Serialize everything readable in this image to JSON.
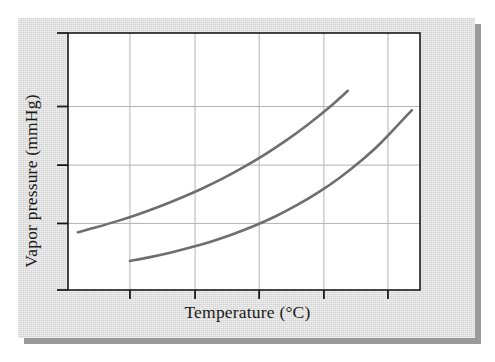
{
  "figure": {
    "background_color": "#dcdcdc",
    "shadow_color": "#9a9a9a",
    "plot_background_color": "#ffffff",
    "axis_color": "#1a1a1a",
    "grid_color": "#b3b3b3",
    "curve_color": "#6e6e6e"
  },
  "chart_data": {
    "type": "line",
    "title": "",
    "subtitle": "",
    "xlabel": "Temperature (°C)",
    "ylabel": "Vapor pressure (mmHg)",
    "x_tick_labels": [
      "",
      "",
      "",
      "",
      "",
      ""
    ],
    "y_tick_labels": [
      "",
      "",
      "",
      "",
      ""
    ],
    "xlim": [
      0,
      100
    ],
    "ylim": [
      0,
      100
    ],
    "grid": true,
    "grid_x_positions": [
      17.6,
      36.1,
      54.3,
      72.7,
      90.9
    ],
    "grid_y_positions": [
      25.9,
      48.6,
      71.4
    ],
    "legend": null,
    "legend_position": "none",
    "annotations": [],
    "series": [
      {
        "name": "curve-1",
        "comment": "upper-left curve: more volatile liquid, lower boiling point",
        "x": [
          2.8,
          8.0,
          14.0,
          20.0,
          26.0,
          32.0,
          38.0,
          44.0,
          50.0,
          56.0,
          62.0,
          68.0,
          74.0,
          79.5
        ],
        "y": [
          22.5,
          24.4,
          26.8,
          29.5,
          32.5,
          35.8,
          39.4,
          43.4,
          47.9,
          52.8,
          58.2,
          64.2,
          70.8,
          77.5
        ]
      },
      {
        "name": "curve-2",
        "comment": "lower-right curve: less volatile liquid, higher boiling point",
        "x": [
          17.6,
          23.0,
          29.0,
          35.0,
          41.0,
          47.0,
          53.0,
          59.0,
          65.0,
          71.0,
          77.0,
          83.0,
          89.0,
          97.7
        ],
        "y": [
          11.3,
          12.7,
          14.5,
          16.6,
          19.0,
          21.8,
          25.0,
          28.7,
          33.0,
          37.9,
          43.5,
          50.0,
          57.4,
          70.0
        ]
      }
    ]
  },
  "axis": {
    "x_title": "Temperature (°C)",
    "y_title": "Vapor pressure (mmHg)"
  }
}
